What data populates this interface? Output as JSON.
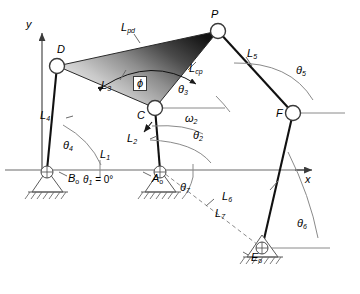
{
  "figure": {
    "type": "kinematic-linkage-diagram"
  },
  "axes": {
    "x_label": "x",
    "y_label": "y",
    "ground_angle_label": "θ",
    "ground_angle_sub": "1",
    "ground_angle_value": "= 0°"
  },
  "joints": [
    {
      "name": "D",
      "label": "D",
      "type": "pin",
      "x": 57,
      "y": 66
    },
    {
      "name": "P",
      "label": "P",
      "type": "pin",
      "x": 218,
      "y": 31
    },
    {
      "name": "C",
      "label": "C",
      "type": "pin",
      "x": 155,
      "y": 108
    },
    {
      "name": "F",
      "label": "F",
      "type": "pin",
      "x": 293,
      "y": 113
    },
    {
      "name": "B0",
      "label": "B",
      "sub": "o",
      "type": "ground",
      "x": 47,
      "y": 170
    },
    {
      "name": "A0",
      "label": "A",
      "sub": "o",
      "type": "ground",
      "x": 160,
      "y": 170
    },
    {
      "name": "E0",
      "label": "E",
      "sub": "o",
      "type": "ground",
      "x": 262,
      "y": 248
    }
  ],
  "links": [
    {
      "name": "L1",
      "label": "L",
      "sub": "1",
      "style": "ground",
      "from": "B0",
      "to": "A0"
    },
    {
      "name": "L2",
      "label": "L",
      "sub": "2",
      "style": "solid",
      "from": "A0",
      "to": "C"
    },
    {
      "name": "L3",
      "label": "L",
      "sub": "3",
      "style": "coupler",
      "from": "C",
      "to": "D"
    },
    {
      "name": "L4",
      "label": "L",
      "sub": "4",
      "style": "solid",
      "from": "B0",
      "to": "D"
    },
    {
      "name": "L5",
      "label": "L",
      "sub": "5",
      "style": "solid",
      "from": "P",
      "to": "F"
    },
    {
      "name": "L6",
      "label": "L",
      "sub": "6",
      "style": "solid",
      "from": "F",
      "to": "E0"
    },
    {
      "name": "L7",
      "label": "L",
      "sub": "7",
      "style": "dashed",
      "from": "A0",
      "to": "E0"
    },
    {
      "name": "Lpd",
      "label": "L",
      "sub": "pd",
      "style": "coupler",
      "from": "P",
      "to": "D"
    },
    {
      "name": "Lcp",
      "label": "L",
      "sub": "cp",
      "style": "coupler",
      "from": "C",
      "to": "P"
    }
  ],
  "angles": [
    {
      "name": "theta1",
      "label": "θ",
      "sub": "1",
      "at": "A0",
      "note": "= 0°"
    },
    {
      "name": "theta2",
      "label": "θ",
      "sub": "2",
      "at": "A0"
    },
    {
      "name": "theta3",
      "label": "θ",
      "sub": "3",
      "at": "C"
    },
    {
      "name": "theta4",
      "label": "θ",
      "sub": "4",
      "at": "B0"
    },
    {
      "name": "theta5",
      "label": "θ",
      "sub": "5",
      "at": "F"
    },
    {
      "name": "theta6",
      "label": "θ",
      "sub": "6",
      "at": "E0"
    },
    {
      "name": "theta7",
      "label": "θ",
      "sub": "7",
      "at": "A0"
    },
    {
      "name": "omega2",
      "label": "ω",
      "sub": "2",
      "at": "C",
      "kind": "angular-velocity"
    },
    {
      "name": "phi",
      "label": "ϕ",
      "at": "coupler",
      "kind": "coupler-apex-angle"
    }
  ],
  "colors": {
    "line": "#1a1a1a",
    "thin_line": "#6b6b6b",
    "coupler_light": "#e8e8e8",
    "coupler_dark": "#161616",
    "ground_hatch": "#6b6b6b",
    "background": "#ffffff"
  }
}
